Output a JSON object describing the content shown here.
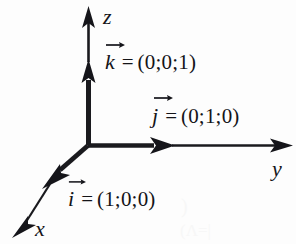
{
  "figure": {
    "background_color": "#fdfdfd",
    "ink_color": "#16161a"
  },
  "axes": [
    {
      "id": "x",
      "label": "x",
      "direction": "down-left (toward viewer)"
    },
    {
      "id": "y",
      "label": "y",
      "direction": "right"
    },
    {
      "id": "z",
      "label": "z",
      "direction": "up"
    }
  ],
  "origin": {
    "label": "O",
    "x": 88,
    "y": 145
  },
  "vectors": [
    {
      "id": "k",
      "symbol": "k",
      "equals": "=",
      "coords": "(0;0;1)",
      "axis": "z",
      "components": [
        0,
        0,
        1
      ]
    },
    {
      "id": "j",
      "symbol": "j",
      "equals": "=",
      "coords": "(0;1;0)",
      "axis": "y",
      "components": [
        0,
        1,
        0
      ]
    },
    {
      "id": "i",
      "symbol": "i",
      "equals": "=",
      "coords": "(1;0;0)",
      "axis": "x",
      "components": [
        1,
        0,
        0
      ]
    }
  ],
  "ghost_marks": {
    "mark_one": ")",
    "mark_two": "(Λ=|"
  }
}
